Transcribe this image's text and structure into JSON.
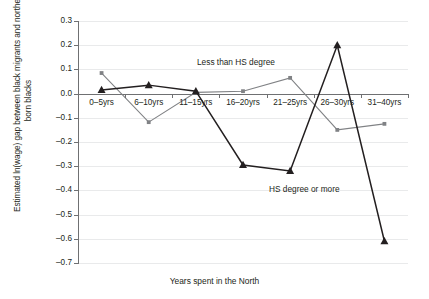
{
  "chart_data": {
    "type": "line",
    "title": "",
    "xlabel": "Years spent in the North",
    "ylabel": "Estimated ln(wage) gap between black migrants and northern-born blacks",
    "categories": [
      "0–5yrs",
      "6–10yrs",
      "11–15yrs",
      "16–20yrs",
      "21–25yrs",
      "26–30yrs",
      "31–40yrs"
    ],
    "ylim": [
      -0.7,
      0.3
    ],
    "yticks": [
      0.3,
      0.2,
      0.1,
      0.0,
      -0.1,
      -0.2,
      -0.3,
      -0.4,
      -0.5,
      -0.6,
      -0.7
    ],
    "ytick_labels": [
      "0.3",
      "0.2",
      "0.1",
      "0.0",
      "–0.1",
      "–0.2",
      "–0.3",
      "–0.4",
      "–0.5",
      "–0.6",
      "–0.7"
    ],
    "grid": true,
    "legend_position": "inline-annotations",
    "zero_line": 0.0,
    "series": [
      {
        "name": "Less than HS degree",
        "color": "#808285",
        "marker": "square",
        "values": [
          0.085,
          -0.118,
          0.005,
          0.01,
          0.065,
          -0.15,
          -0.125
        ]
      },
      {
        "name": "HS degree or more",
        "color": "#231f20",
        "marker": "triangle",
        "values": [
          0.015,
          0.035,
          0.01,
          -0.295,
          -0.32,
          0.2,
          -0.61
        ]
      }
    ],
    "annotations": [
      {
        "text": "Less than HS degree",
        "series": "Less than HS degree"
      },
      {
        "text": "HS degree or more",
        "series": "HS degree or more"
      }
    ]
  }
}
